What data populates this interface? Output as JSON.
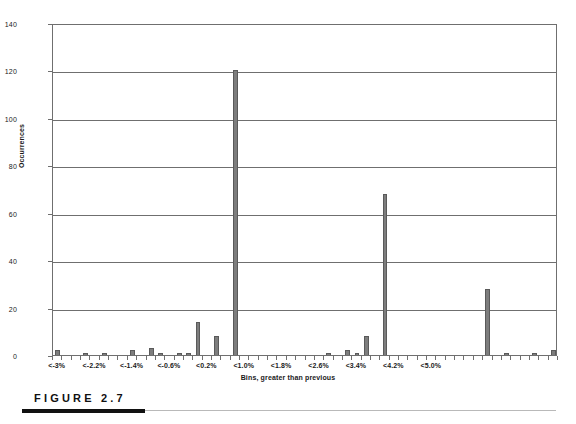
{
  "figure": {
    "caption": "FIGURE 2.7"
  },
  "chart_data": {
    "type": "bar",
    "title": "",
    "xlabel": "Bins, greater than previous",
    "ylabel": "Occurrences",
    "ylim": [
      0,
      140
    ],
    "ytick_labels": [
      "0",
      "20",
      "40",
      "60",
      "80",
      "100",
      "120",
      "140"
    ],
    "ytick_values": [
      0,
      20,
      40,
      60,
      80,
      100,
      120,
      140
    ],
    "grid": true,
    "legend": "none",
    "xtick_labels": [
      "<-3%",
      "<-2.2%",
      "<-1.4%",
      "<-0.6%",
      "<0.2%",
      "<1.0%",
      "<1.8%",
      "<2.6%",
      "<3.4%",
      "<4.2%",
      "<5.0%"
    ],
    "xtick_label_positions": [
      0,
      4,
      8,
      12,
      16,
      20,
      24,
      28,
      32,
      36,
      40
    ],
    "bin_step_percent": 0.2,
    "n_bins": 44,
    "values": [
      2,
      0,
      0,
      1,
      0,
      1,
      0,
      0,
      2,
      0,
      3,
      1,
      0,
      1,
      1,
      14,
      0,
      8,
      0,
      120,
      0,
      0,
      0,
      0,
      0,
      0,
      0,
      0,
      0,
      1,
      0,
      2,
      1,
      8,
      0,
      68,
      0,
      0,
      0,
      0,
      0,
      0,
      0,
      0
    ],
    "tail_values": [
      0,
      0,
      28,
      0,
      1,
      0,
      0,
      1,
      0,
      2
    ],
    "max_value": 120,
    "notable_peaks": [
      {
        "bin": "<-0.6%",
        "value": 120
      },
      {
        "bin": "<1.8%",
        "value": 68
      },
      {
        "bin": "<4.0%",
        "value": 28
      },
      {
        "bin": "<-1.2%",
        "value": 14
      },
      {
        "bin": "<1.6%",
        "value": 8
      },
      {
        "bin": "<-0.8%",
        "value": 8
      }
    ]
  }
}
